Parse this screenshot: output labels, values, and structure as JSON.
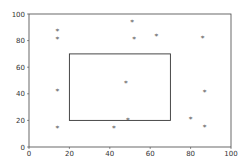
{
  "chart_data": {
    "type": "scatter",
    "title": "",
    "xlabel": "",
    "ylabel": "",
    "xlim": [
      0,
      100
    ],
    "ylim": [
      0,
      100
    ],
    "grid": false,
    "xticks": [
      0,
      20,
      40,
      60,
      80,
      100
    ],
    "yticks": [
      0,
      20,
      40,
      60,
      80,
      100
    ],
    "marker": "*",
    "marker_color": "#555555",
    "points": [
      {
        "x": 14,
        "y": 87
      },
      {
        "x": 14,
        "y": 81
      },
      {
        "x": 14,
        "y": 42
      },
      {
        "x": 14,
        "y": 14
      },
      {
        "x": 51,
        "y": 94
      },
      {
        "x": 52,
        "y": 81
      },
      {
        "x": 63,
        "y": 83
      },
      {
        "x": 86,
        "y": 82
      },
      {
        "x": 48,
        "y": 48
      },
      {
        "x": 87,
        "y": 41
      },
      {
        "x": 80,
        "y": 21
      },
      {
        "x": 87,
        "y": 15
      },
      {
        "x": 42,
        "y": 14
      },
      {
        "x": 49,
        "y": 20
      }
    ],
    "annotations": [
      {
        "type": "rectangle",
        "x0": 20,
        "y0": 20,
        "x1": 70,
        "y1": 70,
        "color": "#333333"
      }
    ]
  }
}
